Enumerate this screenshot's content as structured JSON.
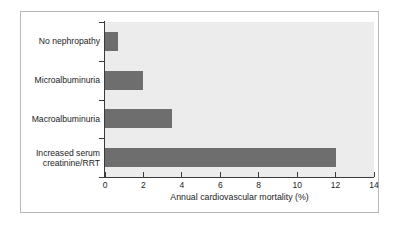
{
  "figure": {
    "background_color": "#ffffff",
    "frame_color": "#b9b9b9",
    "plot_background_color": "#ececec",
    "bar_color": "#6e6e6e",
    "axis_color": "#3a3a3a"
  },
  "chart_data": {
    "type": "bar",
    "orientation": "horizontal",
    "title": "",
    "subtitle": "",
    "xlabel": "Annual cardiovascular mortality (%)",
    "ylabel": "",
    "categories": [
      "No nephropathy",
      "Microalbuminuria",
      "Macroalbuminuria",
      "Increased serum\ncreatinine/RRT"
    ],
    "values": [
      0.7,
      2.0,
      3.5,
      12.0
    ],
    "xlim": [
      0,
      14
    ],
    "xticks": [
      0,
      2,
      4,
      6,
      8,
      10,
      12,
      14
    ],
    "xtick_labels": [
      "0",
      "2",
      "4",
      "6",
      "8",
      "10",
      "12",
      "14"
    ],
    "grid": false,
    "legend": null,
    "annotations": []
  }
}
